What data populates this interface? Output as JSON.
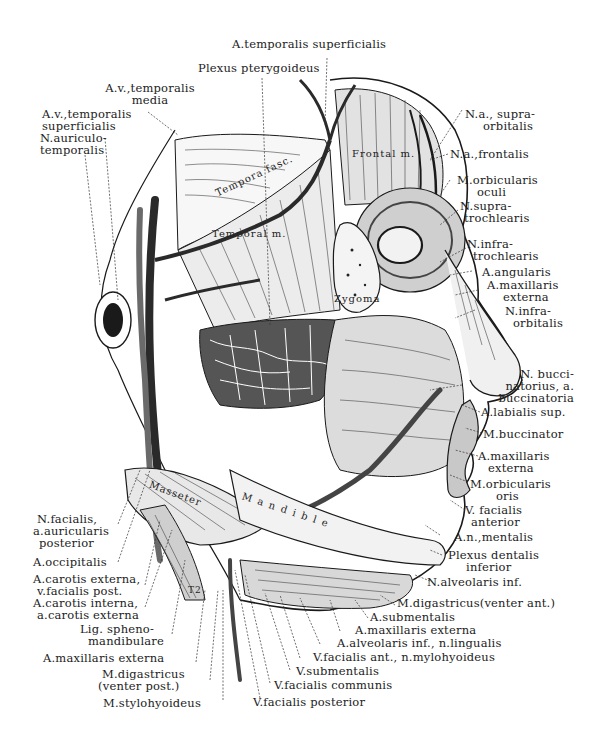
{
  "figure": {
    "ink_color": "#1a1a1a",
    "background_color": "#ffffff"
  },
  "labels_top": [
    {
      "id": "a-temporalis-superficialis",
      "lines": [
        "A.temporalis superficialis"
      ]
    },
    {
      "id": "plexus-pterygoideus",
      "lines": [
        "Plexus pterygoideus"
      ]
    },
    {
      "id": "av-temporalis-media",
      "lines": [
        "A.v.,temporalis",
        "media"
      ]
    },
    {
      "id": "av-temporalis-superficialis",
      "lines": [
        "A.v.,temporalis",
        "superficialis"
      ]
    },
    {
      "id": "n-auriculotemporalis",
      "lines": [
        "N.auriculo-",
        "temporalis"
      ]
    }
  ],
  "labels_right": [
    {
      "id": "na-supraorbitalis",
      "lines": [
        "N.a., supra-",
        "orbitalis"
      ]
    },
    {
      "id": "na-frontalis",
      "lines": [
        "N.a.,frontalis"
      ]
    },
    {
      "id": "m-orbicularis-oculi",
      "lines": [
        "M.orbicularis",
        "oculi"
      ]
    },
    {
      "id": "n-supratrochlearis",
      "lines": [
        "N.supra-",
        "trochlearis"
      ]
    },
    {
      "id": "n-infratrochlearis",
      "lines": [
        "N.infra-",
        "trochlearis"
      ]
    },
    {
      "id": "a-angularis",
      "lines": [
        "A.angularis"
      ]
    },
    {
      "id": "a-maxillaris-externa-upper",
      "lines": [
        "A.maxillaris",
        "externa"
      ]
    },
    {
      "id": "n-infraorbitalis",
      "lines": [
        "N.infra-",
        "orbitalis"
      ]
    },
    {
      "id": "n-buccinatorius",
      "lines": [
        "N. bucci-",
        "natorius, a.",
        "buccinatoria"
      ]
    },
    {
      "id": "a-labialis-sup",
      "lines": [
        "A.labialis sup."
      ]
    },
    {
      "id": "m-buccinator",
      "lines": [
        "M.buccinator"
      ]
    },
    {
      "id": "a-maxillaris-externa-mid",
      "lines": [
        "A.maxillaris",
        "externa"
      ]
    },
    {
      "id": "m-orbicularis-oris",
      "lines": [
        "M.orbicularis",
        "oris"
      ]
    },
    {
      "id": "v-facialis-anterior",
      "lines": [
        "V. facialis",
        "anterior"
      ]
    },
    {
      "id": "an-mentalis",
      "lines": [
        "A.n.,mentalis"
      ]
    },
    {
      "id": "plexus-dentalis-inferior",
      "lines": [
        "Plexus dentalis",
        "inferior"
      ]
    },
    {
      "id": "n-alveolaris-inf",
      "lines": [
        "N.alveolaris inf."
      ]
    }
  ],
  "labels_bottom": [
    {
      "id": "m-digastricus-venter-ant",
      "lines": [
        "M.digastricus(venter ant.)"
      ]
    },
    {
      "id": "a-submentalis",
      "lines": [
        "A.submentalis"
      ]
    },
    {
      "id": "a-maxillaris-externa-bottom",
      "lines": [
        "A.maxillaris externa"
      ]
    },
    {
      "id": "a-alveolaris-inf-n-lingualis",
      "lines": [
        "A.alveolaris inf., n.lingualis"
      ]
    },
    {
      "id": "v-facialis-ant-n-mylohyoideus",
      "lines": [
        "V.facialis ant., n.mylohyoideus"
      ]
    },
    {
      "id": "v-submentalis",
      "lines": [
        "V.submentalis"
      ]
    },
    {
      "id": "v-facialis-communis",
      "lines": [
        "V.facialis communis"
      ]
    },
    {
      "id": "v-facialis-posterior",
      "lines": [
        "V.facialis posterior"
      ]
    }
  ],
  "labels_left": [
    {
      "id": "n-facialis-a-auricularis-posterior",
      "lines": [
        "N.facialis,",
        "a.auricularis",
        "posterior"
      ]
    },
    {
      "id": "a-occipitalis",
      "lines": [
        "A.occipitalis"
      ]
    },
    {
      "id": "a-carotis-externa-v-facialis-post",
      "lines": [
        "A.carotis externa,",
        "v.facialis post."
      ]
    },
    {
      "id": "a-carotis-interna-a-carotis-externa",
      "lines": [
        "A.carotis interna,",
        "a.carotis externa"
      ]
    },
    {
      "id": "lig-sphenomandibulare",
      "lines": [
        "Lig. spheno-",
        "mandibulare"
      ]
    },
    {
      "id": "a-maxillaris-externa-left",
      "lines": [
        "A.maxillaris externa"
      ]
    },
    {
      "id": "m-digastricus-venter-post",
      "lines": [
        "M.digastricus",
        "(venter post.)"
      ]
    },
    {
      "id": "m-stylohyoideus",
      "lines": [
        "M.stylohyoideus"
      ]
    }
  ],
  "labels_inner": {
    "temporal_fascia": "Tempora fasc.",
    "temporal_muscle": "Temporal m.",
    "frontal_muscle": "Frontal m.",
    "zygoma": "Zygoma",
    "masseter": "Masseter",
    "mandible": "Mandible",
    "marker": "T2"
  }
}
